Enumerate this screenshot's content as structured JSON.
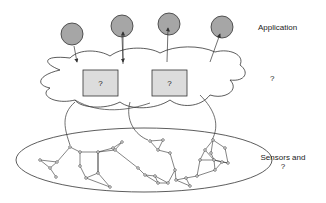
{
  "labels": {
    "application": "Application",
    "middle": "?",
    "sensors_line1": "Sensors and",
    "sensors_line2": "?"
  },
  "boxes": [
    {
      "label": "?"
    },
    {
      "label": "?"
    }
  ],
  "colors": {
    "app_node_fill": "#a6a6a6",
    "box_fill": "#dcdcdc",
    "stroke": "#333333"
  }
}
